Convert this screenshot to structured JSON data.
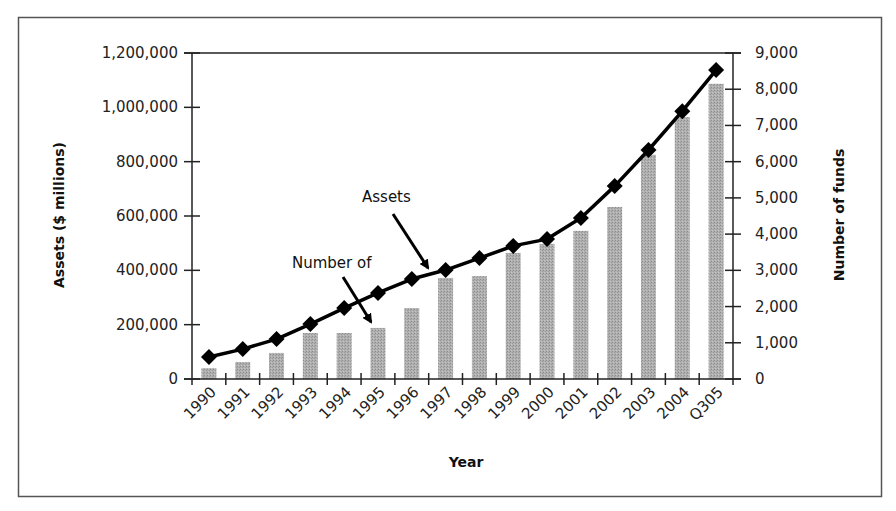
{
  "chart_data": {
    "type": "bar+line",
    "title": "",
    "xlabel": "Year",
    "ylabel_left": "Assets ($ millions)",
    "ylabel_right": "Number of funds",
    "categories": [
      "1990",
      "1991",
      "1992",
      "1993",
      "1994",
      "1995",
      "1996",
      "1997",
      "1998",
      "1999",
      "2000",
      "2001",
      "2002",
      "2003",
      "2004",
      "Q305"
    ],
    "series": [
      {
        "name": "Assets",
        "type": "line",
        "axis": "left",
        "marker": "diamond",
        "color": "#000000",
        "values": [
          81000,
          110000,
          147000,
          202000,
          261000,
          317000,
          368000,
          401000,
          445000,
          490000,
          515000,
          593000,
          710000,
          843000,
          986000,
          1137000
        ]
      },
      {
        "name": "Number of funds",
        "type": "bar",
        "axis": "right",
        "color": "#a9a9a9",
        "values": [
          300,
          470,
          720,
          1270,
          1270,
          1410,
          1960,
          2790,
          2840,
          3480,
          3730,
          4090,
          4750,
          6190,
          7230,
          8150
        ]
      }
    ],
    "ylim_left": [
      0,
      1200000
    ],
    "ylim_right": [
      0,
      9000
    ],
    "yticks_left": [
      "0",
      "200,000",
      "400,000",
      "600,000",
      "800,000",
      "1,000,000",
      "1,200,000"
    ],
    "yticks_right": [
      "0",
      "1,000",
      "2,000",
      "3,000",
      "4,000",
      "5,000",
      "6,000",
      "7,000",
      "8,000",
      "9,000"
    ],
    "grid": false,
    "legend": "none",
    "annotations": [
      {
        "text": "Assets",
        "points_to": "line",
        "target_category": "1997"
      },
      {
        "text": "Number of",
        "points_to": "bars",
        "target_category": "1995"
      }
    ]
  }
}
